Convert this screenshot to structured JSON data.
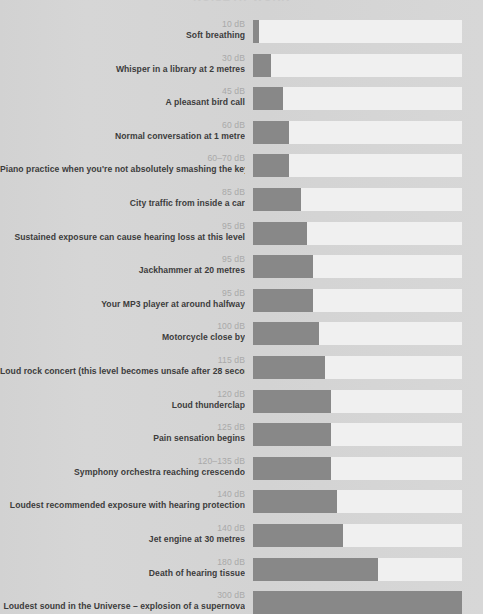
{
  "title": "NOISE AT WORK",
  "colors": {
    "background": "#d4d4d4",
    "segment_filled": "#888888",
    "segment_empty": "#f0f0f0",
    "db_label": "#a9a9a9",
    "description_label": "#3c3c3c"
  },
  "chart_data": {
    "type": "bar",
    "title": "NOISE AT WORK",
    "xlabel": "",
    "ylabel": "",
    "grid": false,
    "legend": "none",
    "unit": "dB",
    "segments_total": 35,
    "xlim": [
      0,
      300
    ],
    "categories": [
      "Soft breathing",
      "Whisper in a library at 2 metres",
      "A pleasant bird call",
      "Normal conversation at 1 metre",
      "Piano practice when you're not absolutely smashing the keys",
      "City traffic from inside a car",
      "Sustained exposure can cause hearing loss at this level",
      "Jackhammer at 20 metres",
      "Your MP3 player at around halfway",
      "Motorcycle close by",
      "Loud rock concert (this level becomes unsafe after 28 seconds)",
      "Loud thunderclap",
      "Pain sensation begins",
      "Symphony orchestra reaching crescendo",
      "Loudest recommended exposure with hearing protection",
      "Jet engine at 30 metres",
      "Death of hearing tissue",
      "Loudest sound in the Universe – explosion of a supernova"
    ],
    "tick_labels": [
      "10 dB",
      "30 dB",
      "45 dB",
      "60 dB",
      "60–70 dB",
      "85 dB",
      "95 dB",
      "95 dB",
      "95 dB",
      "100 dB",
      "115 dB",
      "120 dB",
      "125 dB",
      "120–135 dB",
      "140 dB",
      "140 dB",
      "180 dB",
      "300 dB"
    ],
    "values": [
      10,
      30,
      45,
      60,
      70,
      85,
      95,
      95,
      95,
      100,
      115,
      120,
      125,
      135,
      140,
      140,
      180,
      300
    ],
    "values_filled_segments": [
      1,
      3,
      5,
      6,
      6,
      8,
      9,
      10,
      10,
      11,
      12,
      13,
      13,
      13,
      14,
      15,
      21,
      35
    ]
  },
  "rows": [
    {
      "db": "10 dB",
      "desc": "Soft breathing",
      "filled": 1
    },
    {
      "db": "30 dB",
      "desc": "Whisper in a library at 2 metres",
      "filled": 3
    },
    {
      "db": "45 dB",
      "desc": "A pleasant bird call",
      "filled": 5
    },
    {
      "db": "60 dB",
      "desc": "Normal conversation at 1 metre",
      "filled": 6
    },
    {
      "db": "60–70 dB",
      "desc": "Piano practice when you're not absolutely smashing the keys",
      "filled": 6
    },
    {
      "db": "85 dB",
      "desc": "City traffic from inside a car",
      "filled": 8
    },
    {
      "db": "95 dB",
      "desc": "Sustained exposure can cause hearing loss at this level",
      "filled": 9
    },
    {
      "db": "95 dB",
      "desc": "Jackhammer at 20 metres",
      "filled": 10
    },
    {
      "db": "95 dB",
      "desc": "Your MP3 player at around halfway",
      "filled": 10
    },
    {
      "db": "100 dB",
      "desc": "Motorcycle close by",
      "filled": 11
    },
    {
      "db": "115 dB",
      "desc": "Loud rock concert (this level becomes unsafe after 28 seconds)",
      "filled": 12
    },
    {
      "db": "120 dB",
      "desc": "Loud thunderclap",
      "filled": 13
    },
    {
      "db": "125 dB",
      "desc": "Pain sensation begins",
      "filled": 13
    },
    {
      "db": "120–135 dB",
      "desc": "Symphony orchestra reaching crescendo",
      "filled": 13
    },
    {
      "db": "140 dB",
      "desc": "Loudest recommended exposure with hearing protection",
      "filled": 14
    },
    {
      "db": "140 dB",
      "desc": "Jet engine at 30 metres",
      "filled": 15
    },
    {
      "db": "180 dB",
      "desc": "Death of hearing tissue",
      "filled": 21
    },
    {
      "db": "300 dB",
      "desc": "Loudest sound in the Universe – explosion of a supernova",
      "filled": 35
    }
  ]
}
